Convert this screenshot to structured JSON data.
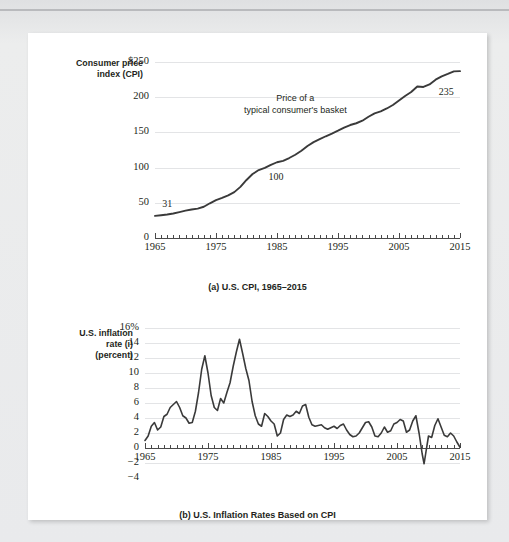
{
  "figure": {
    "background_color": "#e9eaec",
    "card_color": "#ffffff",
    "line_color": "#3a3a3a",
    "grid_color": "#e3e4e6"
  },
  "chart_data": [
    {
      "id": "cpi",
      "type": "line",
      "title": "(a) U.S. CPI, 1965–2015",
      "ylabel": "Consumer price index (CPI)",
      "ylabel_lines": [
        "Consumer price",
        "index (CPI)"
      ],
      "xlabel": "",
      "xlim": [
        1965,
        2015
      ],
      "ylim": [
        0,
        250
      ],
      "ytick_labels": [
        "$250",
        "200",
        "150",
        "100",
        "50",
        "0"
      ],
      "yticks": [
        250,
        200,
        150,
        100,
        50,
        0
      ],
      "xtick_labels": [
        "1965",
        "1975",
        "1985",
        "1995",
        "2005",
        "2015"
      ],
      "xticks": [
        1965,
        1975,
        1985,
        1995,
        2005,
        2015
      ],
      "minor_tick_interval": 1,
      "grid": true,
      "legend": "none",
      "annotations": [
        {
          "name": "basket-annotation",
          "text_lines": [
            "Price of a",
            "typical consumer's basket"
          ],
          "x": 1988,
          "y": 196
        },
        {
          "name": "start-value-label",
          "text": "31",
          "x": 1966.2,
          "y": 47
        },
        {
          "name": "mid-value-label",
          "text": "100",
          "x": 1983.6,
          "y": 86
        },
        {
          "name": "end-value-label",
          "text": "235",
          "x": 2011.5,
          "y": 206
        }
      ],
      "x": [
        1965,
        1966,
        1967,
        1968,
        1969,
        1970,
        1971,
        1972,
        1973,
        1974,
        1975,
        1976,
        1977,
        1978,
        1979,
        1980,
        1981,
        1982,
        1983,
        1984,
        1985,
        1986,
        1987,
        1988,
        1989,
        1990,
        1991,
        1992,
        1993,
        1994,
        1995,
        1996,
        1997,
        1998,
        1999,
        2000,
        2001,
        2002,
        2003,
        2004,
        2005,
        2006,
        2007,
        2008,
        2009,
        2010,
        2011,
        2012,
        2013,
        2014,
        2015
      ],
      "values": [
        31.5,
        32.4,
        33.4,
        34.8,
        36.7,
        38.8,
        40.5,
        41.8,
        44.4,
        49.3,
        53.8,
        56.9,
        60.6,
        65.2,
        72.6,
        82.4,
        90.9,
        96.5,
        99.6,
        103.9,
        107.6,
        109.6,
        113.6,
        118.3,
        124.0,
        130.7,
        136.2,
        140.3,
        144.5,
        148.2,
        152.4,
        156.9,
        160.5,
        163.0,
        166.6,
        172.2,
        177.1,
        179.9,
        184.0,
        188.9,
        195.3,
        201.6,
        207.3,
        215.3,
        214.5,
        218.1,
        224.9,
        229.6,
        233.0,
        236.7,
        237.0
      ]
    },
    {
      "id": "inflation",
      "type": "line",
      "title": "(b) U.S. Inflation Rates Based on CPI",
      "ylabel": "U.S. inflation rate (i) (percent)",
      "ylabel_lines": [
        "U.S. inflation",
        "rate (i)",
        "(percent)"
      ],
      "xlabel": "",
      "xlim": [
        1965,
        2015
      ],
      "ylim": [
        -4,
        16
      ],
      "ytick_labels": [
        "16%",
        "14",
        "12",
        "10",
        "8",
        "6",
        "4",
        "2",
        "0",
        "−2",
        "−4"
      ],
      "yticks": [
        16,
        14,
        12,
        10,
        8,
        6,
        4,
        2,
        0,
        -2,
        -4
      ],
      "xtick_labels": [
        "1965",
        "1975",
        "1985",
        "1995",
        "2005",
        "2015"
      ],
      "xticks": [
        1965,
        1975,
        1985,
        1995,
        2005,
        2015
      ],
      "minor_tick_interval": 1,
      "grid": true,
      "legend": "none",
      "annotations": [],
      "x": [
        1965.0,
        1965.5,
        1966.0,
        1966.5,
        1967.0,
        1967.5,
        1968.0,
        1968.5,
        1969.0,
        1969.5,
        1970.0,
        1970.5,
        1971.0,
        1971.5,
        1972.0,
        1972.5,
        1973.0,
        1973.5,
        1974.0,
        1974.5,
        1975.0,
        1975.5,
        1976.0,
        1976.5,
        1977.0,
        1977.5,
        1978.0,
        1978.5,
        1979.0,
        1979.5,
        1980.0,
        1980.5,
        1981.0,
        1981.5,
        1982.0,
        1982.5,
        1983.0,
        1983.5,
        1984.0,
        1984.5,
        1985.0,
        1985.5,
        1986.0,
        1986.5,
        1987.0,
        1987.5,
        1988.0,
        1988.5,
        1989.0,
        1989.5,
        1990.0,
        1990.5,
        1991.0,
        1991.5,
        1992.0,
        1992.5,
        1993.0,
        1993.5,
        1994.0,
        1994.5,
        1995.0,
        1995.5,
        1996.0,
        1996.5,
        1997.0,
        1997.5,
        1998.0,
        1998.5,
        1999.0,
        1999.5,
        2000.0,
        2000.5,
        2001.0,
        2001.5,
        2002.0,
        2002.5,
        2003.0,
        2003.5,
        2004.0,
        2004.5,
        2005.0,
        2005.5,
        2006.0,
        2006.5,
        2007.0,
        2007.5,
        2008.0,
        2008.5,
        2009.0,
        2009.3,
        2009.6,
        2010.0,
        2010.5,
        2011.0,
        2011.5,
        2012.0,
        2012.5,
        2013.0,
        2013.5,
        2014.0,
        2014.5,
        2015.0
      ],
      "values": [
        1.0,
        1.6,
        2.9,
        3.4,
        2.4,
        2.8,
        4.2,
        4.5,
        5.4,
        5.8,
        6.2,
        5.4,
        4.3,
        4.0,
        3.3,
        3.4,
        4.9,
        7.4,
        10.5,
        12.3,
        10.0,
        7.0,
        5.4,
        5.0,
        6.6,
        6.0,
        7.4,
        8.7,
        10.9,
        12.8,
        14.5,
        12.6,
        10.6,
        9.0,
        6.2,
        4.3,
        3.2,
        2.9,
        4.6,
        4.2,
        3.6,
        3.2,
        1.6,
        2.0,
        3.8,
        4.4,
        4.2,
        4.4,
        4.9,
        4.6,
        5.6,
        5.8,
        4.1,
        3.1,
        2.9,
        3.0,
        3.1,
        2.7,
        2.5,
        2.7,
        2.9,
        2.6,
        3.0,
        3.2,
        2.4,
        1.8,
        1.5,
        1.6,
        2.0,
        2.7,
        3.4,
        3.5,
        2.8,
        1.6,
        1.5,
        2.0,
        2.8,
        2.1,
        2.3,
        3.2,
        3.4,
        3.8,
        3.6,
        2.1,
        2.4,
        3.6,
        4.3,
        2.0,
        -0.8,
        -2.1,
        -0.5,
        1.6,
        1.4,
        3.0,
        3.9,
        2.8,
        1.7,
        1.5,
        2.0,
        1.6,
        0.8,
        0.1
      ]
    }
  ]
}
